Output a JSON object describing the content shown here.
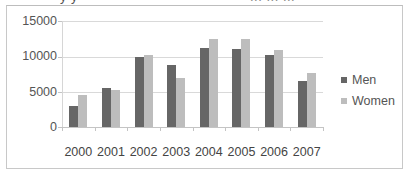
{
  "header": {
    "cut_text_left": "y y",
    "cut_text_right": "... ... ..."
  },
  "chart_data": {
    "type": "bar",
    "title": "",
    "xlabel": "",
    "ylabel": "",
    "categories": [
      "2000",
      "2001",
      "2002",
      "2003",
      "2004",
      "2005",
      "2006",
      "2007"
    ],
    "series": [
      {
        "name": "Men",
        "color": "#666666",
        "values": [
          3000,
          5500,
          9900,
          8800,
          11200,
          11100,
          10200,
          6500
        ]
      },
      {
        "name": "Women",
        "color": "#bdbdbd",
        "values": [
          4500,
          5300,
          10200,
          6900,
          12500,
          12500,
          10900,
          7700
        ]
      }
    ],
    "ylim": [
      0,
      15000
    ],
    "yticks": [
      "0",
      "5000",
      "10000",
      "15000"
    ],
    "grid": true,
    "legend_position": "right"
  },
  "legend": {
    "items": [
      {
        "label": "Men",
        "color": "#666666"
      },
      {
        "label": "Women",
        "color": "#bdbdbd"
      }
    ]
  }
}
